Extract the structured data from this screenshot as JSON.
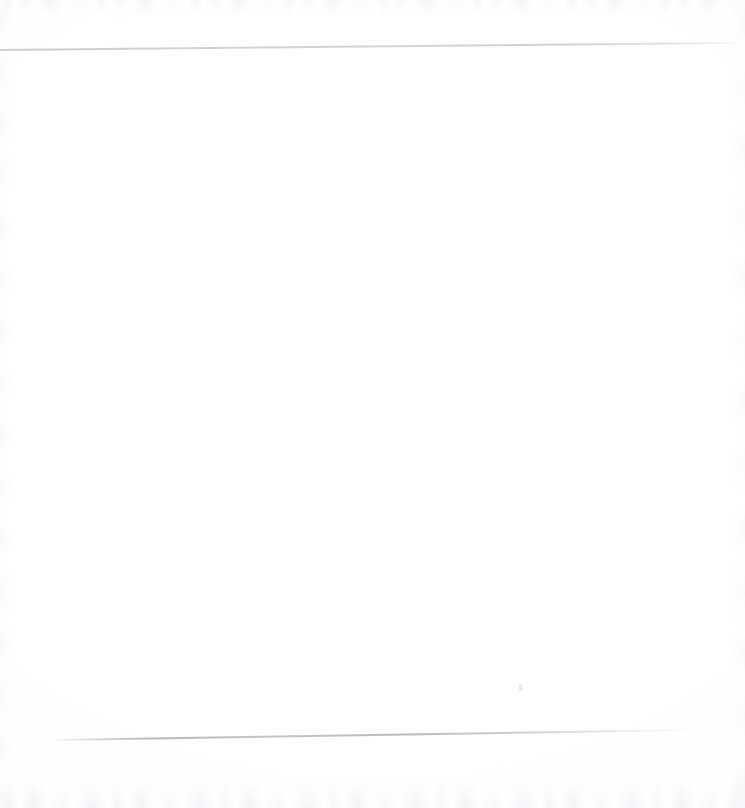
{
  "page": {
    "kind": "scanned-blank-page",
    "width": 745,
    "height": 808,
    "text_content": "",
    "background_color": "#fefeff",
    "paper_tone": "#fdfdfe"
  },
  "marks": {
    "hairline_top": {
      "name": "top-rule-line",
      "color": "#cbcfd6",
      "start_x": 0,
      "start_y": 49,
      "end_x": 735,
      "end_y": 42,
      "thickness_px": 2
    },
    "hairline_bottom": {
      "name": "bottom-rule-line",
      "color": "#aeb2bb",
      "start_x": 55,
      "start_y": 739,
      "end_x": 692,
      "end_y": 729,
      "thickness_px": 2
    },
    "dust_speck": {
      "name": "scan-dust-speck",
      "color": "#cbc9d6",
      "x": 519,
      "y": 684
    }
  },
  "noise": {
    "top_band_color": "#c4c7cd",
    "bottom_band_color": "#c6c9cf",
    "side_band_color": "#c8cbd1"
  }
}
